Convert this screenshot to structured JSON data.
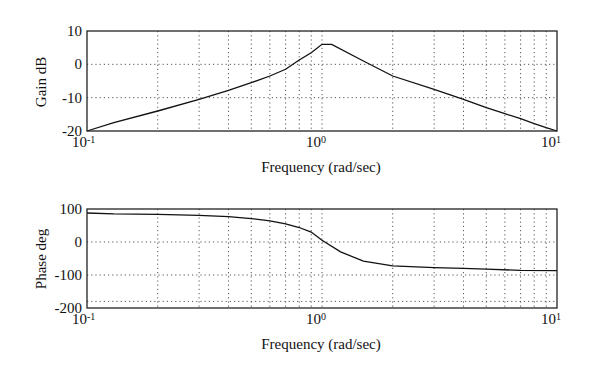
{
  "chart_data": [
    {
      "type": "line",
      "title": "",
      "xlabel": "Frequency (rad/sec)",
      "ylabel": "Gain dB",
      "xscale": "log",
      "xlim": [
        0.1,
        10
      ],
      "ylim": [
        -20,
        10
      ],
      "x_tick_labels": [
        "10-1",
        "10 0",
        "10 1"
      ],
      "y_ticks": [
        10,
        0,
        -10,
        -20
      ],
      "grid": true,
      "series": [
        {
          "name": "Gain",
          "x": [
            0.1,
            0.13,
            0.2,
            0.3,
            0.4,
            0.5,
            0.6,
            0.7,
            0.8,
            0.9,
            1.0,
            1.1,
            1.5,
            2.0,
            3.0,
            4.0,
            5.0,
            6.0,
            7.0,
            8.0,
            9.0,
            10.0
          ],
          "y": [
            -20,
            -17.5,
            -14,
            -10.5,
            -7.8,
            -5.5,
            -3.5,
            -1.5,
            1.3,
            3.5,
            6,
            6,
            1,
            -3.5,
            -7.5,
            -10.5,
            -13,
            -14.8,
            -16.3,
            -17.8,
            -19,
            -20
          ]
        }
      ]
    },
    {
      "type": "line",
      "title": "",
      "xlabel": "Frequency (rad/sec)",
      "ylabel": "Phase deg",
      "xscale": "log",
      "xlim": [
        0.1,
        10
      ],
      "ylim": [
        -200,
        100
      ],
      "x_tick_labels": [
        "10-1",
        "10 0",
        "10 1"
      ],
      "y_ticks": [
        100,
        0,
        -100,
        -200
      ],
      "grid": true,
      "series": [
        {
          "name": "Phase",
          "x": [
            0.1,
            0.13,
            0.2,
            0.3,
            0.4,
            0.5,
            0.6,
            0.7,
            0.8,
            0.9,
            1.0,
            1.2,
            1.5,
            2.0,
            3.0,
            4.0,
            5.0,
            7.0,
            10.0
          ],
          "y": [
            88,
            85,
            84,
            81,
            77,
            71,
            64,
            55,
            44,
            30,
            5,
            -30,
            -58,
            -72,
            -78,
            -80,
            -82,
            -86,
            -87
          ]
        }
      ]
    }
  ],
  "plots": {
    "gain": {
      "ylabel": "Gain dB",
      "xlabel": "Frequency (rad/sec)",
      "yticks": [
        "10",
        "0",
        "-10",
        "-20"
      ],
      "xticks": [
        {
          "base": "10",
          "exp": "-1"
        },
        {
          "base": "10",
          "exp": "0"
        },
        {
          "base": "10",
          "exp": "1"
        }
      ]
    },
    "phase": {
      "ylabel": "Phase deg",
      "xlabel": "Frequency (rad/sec)",
      "yticks": [
        "100",
        "0",
        "-100",
        "-200"
      ],
      "xticks": [
        {
          "base": "10",
          "exp": "-1"
        },
        {
          "base": "10",
          "exp": "0"
        },
        {
          "base": "10",
          "exp": "1"
        }
      ]
    }
  },
  "colors": {
    "line": "#111111",
    "grid": "#555555",
    "axis": "#222222"
  }
}
